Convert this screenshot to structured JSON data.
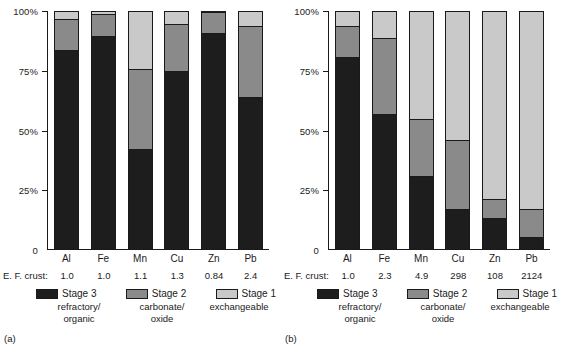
{
  "chart_data": [
    {
      "type": "bar",
      "subtype": "stacked-100-percent",
      "panel_label": "(a)",
      "title": "",
      "xlabel": "",
      "ylabel": "",
      "ylim": [
        0,
        100
      ],
      "grid": false,
      "legend_position": "below",
      "ytick_labels": [
        "100%",
        "75%",
        "50%",
        "25%",
        "0"
      ],
      "ytick_values": [
        100,
        75,
        50,
        25,
        0
      ],
      "categories": [
        "Al",
        "Fe",
        "Mn",
        "Cu",
        "Zn",
        "Pb"
      ],
      "annotation_row_label": "E. F. crust:",
      "annotation_values": [
        "1.0",
        "1.0",
        "1.1",
        "1.3",
        "0.84",
        "2.4"
      ],
      "series": [
        {
          "name": "Stage 3",
          "sublabel": "refractory/ organic",
          "color": "#1d1d1d",
          "values": [
            84,
            90,
            42,
            75,
            91,
            64
          ]
        },
        {
          "name": "Stage 2",
          "sublabel": "carbonate/ oxide",
          "color": "#8a8a8a",
          "values": [
            13,
            9,
            34,
            20,
            9,
            30
          ]
        },
        {
          "name": "Stage 1",
          "sublabel": "exchangeable",
          "color": "#c9c9c9",
          "values": [
            3,
            1,
            24,
            5,
            0,
            6
          ]
        }
      ]
    },
    {
      "type": "bar",
      "subtype": "stacked-100-percent",
      "panel_label": "(b)",
      "title": "",
      "xlabel": "",
      "ylabel": "",
      "ylim": [
        0,
        100
      ],
      "grid": false,
      "legend_position": "below",
      "ytick_labels": [
        "100%",
        "75%",
        "50%",
        "25%",
        "0"
      ],
      "ytick_values": [
        100,
        75,
        50,
        25,
        0
      ],
      "categories": [
        "Al",
        "Fe",
        "Mn",
        "Cu",
        "Zn",
        "Pb"
      ],
      "annotation_row_label": "E. F. crust:",
      "annotation_values": [
        "1.0",
        "2.3",
        "4.9",
        "298",
        "108",
        "2124"
      ],
      "series": [
        {
          "name": "Stage 3",
          "sublabel": "refractory/ organic",
          "color": "#1d1d1d",
          "values": [
            81,
            57,
            31,
            17,
            13,
            5
          ]
        },
        {
          "name": "Stage 2",
          "sublabel": "carbonate/ oxide",
          "color": "#8a8a8a",
          "values": [
            13,
            32,
            24,
            29,
            8,
            12
          ]
        },
        {
          "name": "Stage 1",
          "sublabel": "exchangeable",
          "color": "#c9c9c9",
          "values": [
            6,
            11,
            45,
            54,
            79,
            83
          ]
        }
      ]
    }
  ],
  "legend": {
    "items": [
      {
        "label": "Stage 3",
        "sub_line1": "refractory/",
        "sub_line2": "organic",
        "color": "#1d1d1d"
      },
      {
        "label": "Stage 2",
        "sub_line1": "carbonate/",
        "sub_line2": "oxide",
        "color": "#8a8a8a"
      },
      {
        "label": "Stage 1",
        "sub_line1": "exchangeable",
        "sub_line2": "",
        "color": "#c9c9c9"
      }
    ]
  },
  "colors": {
    "stage3": "#1d1d1d",
    "stage2": "#8a8a8a",
    "stage1": "#c9c9c9",
    "axis": "#1a1a1a",
    "background": "#ffffff"
  }
}
